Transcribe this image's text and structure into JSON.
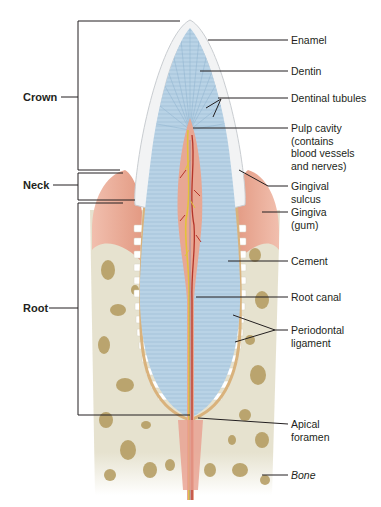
{
  "diagram": {
    "left_labels": [
      {
        "id": "crown",
        "text": "Crown"
      },
      {
        "id": "neck",
        "text": "Neck"
      },
      {
        "id": "root",
        "text": "Root"
      }
    ],
    "right_labels": [
      {
        "id": "enamel",
        "text": "Enamel"
      },
      {
        "id": "dentin",
        "text": "Dentin"
      },
      {
        "id": "dentinal_tubules",
        "text": "Dentinal tubules"
      },
      {
        "id": "pulp_cavity",
        "text": "Pulp cavity\n(contains\nblood vessels\nand nerves)"
      },
      {
        "id": "gingival_sulcus",
        "text": "Gingival\nsulcus"
      },
      {
        "id": "gingiva",
        "text": "Gingiva\n(gum)"
      },
      {
        "id": "cement",
        "text": "Cement"
      },
      {
        "id": "root_canal",
        "text": "Root canal"
      },
      {
        "id": "periodontal_ligament",
        "text": "Periodontal\nligament"
      },
      {
        "id": "apical_foramen",
        "text": "Apical\nforamen"
      },
      {
        "id": "bone",
        "text": "Bone"
      }
    ],
    "colors": {
      "enamel": "#f2f3f4",
      "dentin": "#b9d3e6",
      "pulp": "#e8a793",
      "gingiva": "#e9a58f",
      "bone": "#e6e2cf",
      "bone_spots": "#b39a5e",
      "cement": "#d9b27c",
      "nerve": "#e3c23a",
      "vessel": "#b5352a",
      "leader": "#231f20"
    }
  }
}
